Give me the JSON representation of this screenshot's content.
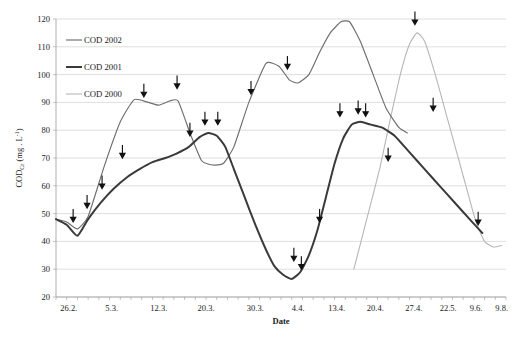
{
  "chart_data": {
    "type": "line",
    "title": "",
    "xlabel": "Date",
    "ylabel": "CODcr (mg . L-1)",
    "ylabel_main": "COD",
    "ylabel_sub": "Cr",
    "ylabel_unit": "(mg . L",
    "ylabel_exp": "-1",
    "ylabel_close": ")",
    "ylim": [
      20,
      120
    ],
    "ytick_step": 10,
    "yticks": [
      120,
      110,
      100,
      90,
      80,
      70,
      60,
      50,
      40,
      30,
      20
    ],
    "grid": true,
    "legend_position": "top-left",
    "categories": [
      "26.2.",
      "5.3.",
      "12.3.",
      "20.3.",
      "30.3.",
      "4.4.",
      "13.4.",
      "20.4.",
      "27.4.",
      "22.5.",
      "9.6.",
      "9.8."
    ],
    "xticks": [
      "26.2.",
      "5.3.",
      "12.3.",
      "20.3.",
      "30.3.",
      "4.4.",
      "13.4.",
      "20.4.",
      "27.4.",
      "22.5.",
      "9.6.",
      "9.8."
    ],
    "series": [
      {
        "name": "COD 2002",
        "color": "#6e6e6e",
        "width": 1.15,
        "points": [
          [
            0.0,
            48
          ],
          [
            1.0,
            47
          ],
          [
            2.0,
            44.5
          ],
          [
            3.0,
            49
          ],
          [
            4.5,
            67
          ],
          [
            6.0,
            83
          ],
          [
            7.3,
            91
          ],
          [
            8.6,
            90
          ],
          [
            9.6,
            89
          ],
          [
            10.6,
            90.5
          ],
          [
            11.4,
            90.5
          ],
          [
            12.6,
            78
          ],
          [
            13.6,
            69
          ],
          [
            14.6,
            67.5
          ],
          [
            15.6,
            68
          ],
          [
            16.6,
            74
          ],
          [
            18.0,
            90
          ],
          [
            19.6,
            104
          ],
          [
            20.8,
            103
          ],
          [
            21.8,
            98
          ],
          [
            22.6,
            97
          ],
          [
            23.6,
            100
          ],
          [
            24.6,
            108
          ],
          [
            25.6,
            115
          ],
          [
            26.6,
            119
          ],
          [
            27.4,
            119
          ],
          [
            28.4,
            112
          ],
          [
            29.6,
            100
          ],
          [
            30.8,
            88
          ],
          [
            32.0,
            81
          ],
          [
            32.8,
            79
          ]
        ]
      },
      {
        "name": "COD 2001",
        "color": "#3a3a3a",
        "width": 2.0,
        "points": [
          [
            0.0,
            48
          ],
          [
            1.0,
            46
          ],
          [
            2.0,
            42
          ],
          [
            3.0,
            48
          ],
          [
            4.2,
            54
          ],
          [
            5.4,
            59
          ],
          [
            6.6,
            63
          ],
          [
            7.8,
            66
          ],
          [
            9.0,
            68.5
          ],
          [
            10.2,
            70
          ],
          [
            11.2,
            71.5
          ],
          [
            12.4,
            74
          ],
          [
            13.4,
            77.5
          ],
          [
            14.2,
            79
          ],
          [
            15.0,
            78
          ],
          [
            15.8,
            74
          ],
          [
            16.6,
            66
          ],
          [
            17.6,
            56
          ],
          [
            18.6,
            46
          ],
          [
            19.6,
            37
          ],
          [
            20.4,
            31
          ],
          [
            21.2,
            28
          ],
          [
            22.0,
            26.5
          ],
          [
            22.8,
            29
          ],
          [
            23.6,
            35
          ],
          [
            24.4,
            44
          ],
          [
            25.2,
            56
          ],
          [
            26.0,
            68
          ],
          [
            26.8,
            77
          ],
          [
            27.6,
            82
          ],
          [
            28.4,
            83
          ],
          [
            29.4,
            82
          ],
          [
            30.4,
            81
          ],
          [
            31.6,
            78
          ],
          [
            33.0,
            72
          ],
          [
            34.4,
            66
          ],
          [
            35.8,
            60
          ],
          [
            37.2,
            54
          ],
          [
            38.6,
            48
          ],
          [
            39.8,
            43
          ]
        ]
      },
      {
        "name": "COD 2000",
        "color": "#b6b6b6",
        "width": 1.1,
        "points": [
          [
            27.8,
            30
          ],
          [
            29.0,
            48
          ],
          [
            30.2,
            66
          ],
          [
            31.2,
            84
          ],
          [
            32.2,
            101
          ],
          [
            33.0,
            111
          ],
          [
            33.7,
            115
          ],
          [
            34.4,
            112
          ],
          [
            35.4,
            100
          ],
          [
            36.4,
            86
          ],
          [
            37.4,
            72
          ],
          [
            38.4,
            58
          ],
          [
            39.2,
            47
          ],
          [
            40.0,
            40
          ],
          [
            40.8,
            38
          ],
          [
            41.6,
            38.5
          ]
        ]
      }
    ],
    "annotations": {
      "name": "sampling-point-arrows",
      "symbol": "down-arrow",
      "points": [
        [
          1.6,
          47
        ],
        [
          2.9,
          52
        ],
        [
          4.3,
          59
        ],
        [
          6.2,
          70
        ],
        [
          8.2,
          92
        ],
        [
          11.3,
          95
        ],
        [
          12.5,
          78
        ],
        [
          13.9,
          82
        ],
        [
          15.1,
          82
        ],
        [
          18.2,
          93
        ],
        [
          21.6,
          102
        ],
        [
          22.2,
          33
        ],
        [
          22.9,
          30
        ],
        [
          24.6,
          47
        ],
        [
          26.5,
          85
        ],
        [
          28.2,
          86
        ],
        [
          28.9,
          85
        ],
        [
          31.0,
          69
        ],
        [
          33.5,
          118
        ],
        [
          35.2,
          87
        ],
        [
          39.4,
          46
        ]
      ]
    }
  },
  "legend": {
    "items": [
      {
        "label": "COD 2002"
      },
      {
        "label": "COD 2001"
      },
      {
        "label": "COD 2000"
      }
    ]
  }
}
